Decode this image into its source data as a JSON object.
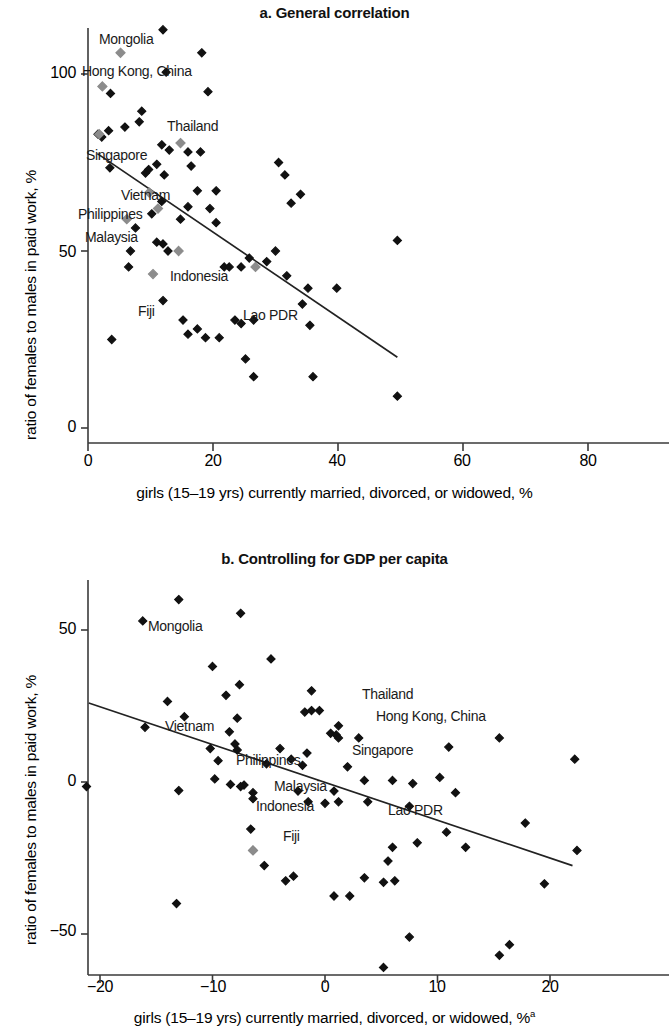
{
  "figure": {
    "panels": [
      {
        "id": "a",
        "title": "a. General correlation",
        "xlabel": "girls (15–19 yrs) currently married, divorced, or widowed, %",
        "ylabel": "ratio of females to males in paid work, %",
        "xlabel_superscript": "",
        "xticks": [
          "0",
          "20",
          "40",
          "60",
          "80"
        ],
        "yticks": [
          "0",
          "50",
          "100"
        ]
      },
      {
        "id": "b",
        "title": "b. Controlling for GDP per capita",
        "xlabel": "girls (15–19 yrs) currently married, divorced, or widowed, %",
        "ylabel": "ratio of females to males in paid work, %",
        "xlabel_superscript": "a",
        "xticks": [
          "−20",
          "−10",
          "0",
          "10",
          "20"
        ],
        "yticks": [
          "−50",
          "0",
          "50"
        ]
      }
    ],
    "colors": {
      "marker": "#111111",
      "highlight_marker": "#8c8c8c",
      "axis": "#3a3a3a",
      "trendline": "#222222",
      "text": "#111111"
    }
  },
  "chart_data": [
    {
      "type": "scatter",
      "panel": "a",
      "title": "a. General correlation",
      "xlabel": "girls (15–19 yrs) currently married, divorced, or widowed, %",
      "ylabel": "ratio of females to males in paid work, %",
      "xlim": [
        0,
        80
      ],
      "ylim": [
        0,
        118
      ],
      "xticks": [
        0,
        20,
        40,
        60,
        80
      ],
      "yticks": [
        0,
        50,
        100
      ],
      "grid": false,
      "legend": null,
      "trendline": {
        "x0": 1.5,
        "y0": 77.5,
        "x1": 49.5,
        "y1": 20.0
      },
      "highlighted_points": [
        {
          "label": "Mongolia",
          "x": 5.2,
          "y": 106.0
        },
        {
          "label": "Hong Kong, China",
          "x": 2.3,
          "y": 96.5
        },
        {
          "label": "Thailand",
          "x": 14.8,
          "y": 80.5
        },
        {
          "label": "Singapore",
          "x": 1.8,
          "y": 83.0
        },
        {
          "label": "Vietnam",
          "x": 9.8,
          "y": 66.5
        },
        {
          "label": "Philippines",
          "x": 11.2,
          "y": 62.0
        },
        {
          "label": "Malaysia",
          "x": 6.2,
          "y": 59.0
        },
        {
          "label": "Indonesia",
          "x": 14.5,
          "y": 50.0
        },
        {
          "label": "Fiji",
          "x": 10.4,
          "y": 43.5
        },
        {
          "label": "Lao PDR",
          "x": 26.8,
          "y": 45.5
        }
      ],
      "points": [
        {
          "x": 12.0,
          "y": 112.5
        },
        {
          "x": 18.2,
          "y": 106.0
        },
        {
          "x": 12.5,
          "y": 100.5
        },
        {
          "x": 3.6,
          "y": 94.5
        },
        {
          "x": 19.2,
          "y": 95.0
        },
        {
          "x": 8.6,
          "y": 89.5
        },
        {
          "x": 5.9,
          "y": 85.0
        },
        {
          "x": 3.3,
          "y": 84.0
        },
        {
          "x": 8.2,
          "y": 86.5
        },
        {
          "x": 1.6,
          "y": 83.0
        },
        {
          "x": 2.2,
          "y": 82.2
        },
        {
          "x": 11.8,
          "y": 80.0
        },
        {
          "x": 16.0,
          "y": 78.0
        },
        {
          "x": 18.0,
          "y": 78.0
        },
        {
          "x": 13.0,
          "y": 78.5
        },
        {
          "x": 3.5,
          "y": 73.5
        },
        {
          "x": 11.0,
          "y": 74.5
        },
        {
          "x": 16.5,
          "y": 74.0
        },
        {
          "x": 9.2,
          "y": 72.0
        },
        {
          "x": 9.7,
          "y": 73.0
        },
        {
          "x": 12.2,
          "y": 71.5
        },
        {
          "x": 30.5,
          "y": 75.0
        },
        {
          "x": 31.5,
          "y": 71.5
        },
        {
          "x": 17.5,
          "y": 67.0
        },
        {
          "x": 20.5,
          "y": 67.0
        },
        {
          "x": 11.8,
          "y": 64.0
        },
        {
          "x": 34.0,
          "y": 66.0
        },
        {
          "x": 32.5,
          "y": 63.5
        },
        {
          "x": 16.0,
          "y": 62.5
        },
        {
          "x": 19.5,
          "y": 62.0
        },
        {
          "x": 10.2,
          "y": 60.5
        },
        {
          "x": 14.8,
          "y": 59.0
        },
        {
          "x": 20.5,
          "y": 58.0
        },
        {
          "x": 7.6,
          "y": 56.5
        },
        {
          "x": 11.0,
          "y": 52.5
        },
        {
          "x": 12.0,
          "y": 52.0
        },
        {
          "x": 6.8,
          "y": 50.0
        },
        {
          "x": 12.8,
          "y": 50.0
        },
        {
          "x": 30.0,
          "y": 50.0
        },
        {
          "x": 49.5,
          "y": 53.0
        },
        {
          "x": 6.5,
          "y": 45.5
        },
        {
          "x": 25.8,
          "y": 48.0
        },
        {
          "x": 21.8,
          "y": 45.5
        },
        {
          "x": 22.6,
          "y": 45.5
        },
        {
          "x": 24.5,
          "y": 45.5
        },
        {
          "x": 28.6,
          "y": 47.0
        },
        {
          "x": 31.8,
          "y": 43.0
        },
        {
          "x": 35.2,
          "y": 39.5
        },
        {
          "x": 39.8,
          "y": 39.5
        },
        {
          "x": 34.3,
          "y": 35.0
        },
        {
          "x": 12.0,
          "y": 36.0
        },
        {
          "x": 35.5,
          "y": 29.0
        },
        {
          "x": 15.2,
          "y": 30.5
        },
        {
          "x": 23.5,
          "y": 30.5
        },
        {
          "x": 24.5,
          "y": 29.5
        },
        {
          "x": 26.5,
          "y": 30.5
        },
        {
          "x": 17.5,
          "y": 28.0
        },
        {
          "x": 16.0,
          "y": 26.5
        },
        {
          "x": 18.8,
          "y": 25.5
        },
        {
          "x": 21.0,
          "y": 25.5
        },
        {
          "x": 3.8,
          "y": 25.0
        },
        {
          "x": 25.2,
          "y": 19.5
        },
        {
          "x": 26.5,
          "y": 14.5
        },
        {
          "x": 36.0,
          "y": 14.5
        },
        {
          "x": 49.5,
          "y": 9.0
        }
      ]
    },
    {
      "type": "scatter",
      "panel": "b",
      "title": "b. Controlling for GDP per capita",
      "xlabel": "girls (15–19 yrs) currently married, divorced, or widowed, %",
      "xlabel_note": "a",
      "ylabel": "ratio of females to males in paid work, %",
      "xlim": [
        -22,
        23
      ],
      "ylim": [
        -62,
        65
      ],
      "xticks": [
        -20,
        -10,
        0,
        10,
        20
      ],
      "yticks": [
        -50,
        0,
        50
      ],
      "grid": false,
      "legend": null,
      "trendline": {
        "x0": -21.0,
        "y0": 26.0,
        "x1": 22.0,
        "y1": -27.5
      },
      "highlighted_points": [
        {
          "label": "Fiji-cluster-gray",
          "x": -6.4,
          "y": -22.5
        }
      ],
      "labeled_points": [
        {
          "label": "Mongolia",
          "x": -16.2,
          "y": 53.0
        },
        {
          "label": "Vietnam",
          "x": -16.0,
          "y": 18.0
        },
        {
          "label": "Thailand",
          "x": -1.2,
          "y": 30.0
        },
        {
          "label": "Hong Kong, China",
          "x": -0.5,
          "y": 24.0
        },
        {
          "label": "Singapore",
          "x": -1.6,
          "y": 9.5
        },
        {
          "label": "Philippines",
          "x": -8.2,
          "y": 7.0
        },
        {
          "label": "Malaysia",
          "x": -7.2,
          "y": -1.0
        },
        {
          "label": "Indonesia",
          "x": -6.4,
          "y": -5.5
        },
        {
          "label": "Lao PDR",
          "x": 1.2,
          "y": -6.5
        },
        {
          "label": "Fiji",
          "x": -6.6,
          "y": -15.5
        }
      ],
      "points": [
        {
          "x": -13.0,
          "y": 60.0
        },
        {
          "x": -7.5,
          "y": 55.5
        },
        {
          "x": -16.2,
          "y": 53.0
        },
        {
          "x": -4.8,
          "y": 40.5
        },
        {
          "x": -10.0,
          "y": 38.0
        },
        {
          "x": -7.6,
          "y": 32.0
        },
        {
          "x": -8.8,
          "y": 28.5
        },
        {
          "x": -14.0,
          "y": 26.5
        },
        {
          "x": -1.2,
          "y": 30.0
        },
        {
          "x": -12.5,
          "y": 21.5
        },
        {
          "x": -7.8,
          "y": 21.0
        },
        {
          "x": -1.8,
          "y": 23.0
        },
        {
          "x": -1.2,
          "y": 23.5
        },
        {
          "x": -0.5,
          "y": 23.5
        },
        {
          "x": 1.2,
          "y": 18.5
        },
        {
          "x": -16.0,
          "y": 18.0
        },
        {
          "x": -8.5,
          "y": 16.5
        },
        {
          "x": 0.5,
          "y": 16.0
        },
        {
          "x": 1.0,
          "y": 15.5
        },
        {
          "x": 1.2,
          "y": 14.5
        },
        {
          "x": 3.0,
          "y": 14.5
        },
        {
          "x": 15.5,
          "y": 14.5
        },
        {
          "x": -8.0,
          "y": 12.5
        },
        {
          "x": -10.2,
          "y": 11.0
        },
        {
          "x": -7.8,
          "y": 10.5
        },
        {
          "x": -4.0,
          "y": 11.0
        },
        {
          "x": -1.6,
          "y": 9.5
        },
        {
          "x": 11.0,
          "y": 11.5
        },
        {
          "x": -9.5,
          "y": 7.0
        },
        {
          "x": -3.0,
          "y": 7.5
        },
        {
          "x": 22.2,
          "y": 7.5
        },
        {
          "x": -5.2,
          "y": 6.0
        },
        {
          "x": -2.0,
          "y": 5.5
        },
        {
          "x": 2.0,
          "y": 5.0
        },
        {
          "x": -9.8,
          "y": 1.0
        },
        {
          "x": 3.5,
          "y": 0.5
        },
        {
          "x": 6.0,
          "y": 0.5
        },
        {
          "x": 10.2,
          "y": 1.5
        },
        {
          "x": -21.2,
          "y": -1.5
        },
        {
          "x": -8.4,
          "y": -0.8
        },
        {
          "x": -7.2,
          "y": -1.0
        },
        {
          "x": -7.5,
          "y": -1.5
        },
        {
          "x": 7.8,
          "y": -0.5
        },
        {
          "x": -13.0,
          "y": -2.8
        },
        {
          "x": -6.4,
          "y": -3.5
        },
        {
          "x": -2.4,
          "y": -3.0
        },
        {
          "x": 0.8,
          "y": -3.0
        },
        {
          "x": 11.6,
          "y": -3.5
        },
        {
          "x": -6.4,
          "y": -5.5
        },
        {
          "x": -1.5,
          "y": -6.5
        },
        {
          "x": 0.0,
          "y": -7.0
        },
        {
          "x": 3.8,
          "y": -6.5
        },
        {
          "x": 1.2,
          "y": -6.5
        },
        {
          "x": 7.5,
          "y": -8.0
        },
        {
          "x": -6.6,
          "y": -15.5
        },
        {
          "x": 17.8,
          "y": -13.5
        },
        {
          "x": 10.8,
          "y": -16.5
        },
        {
          "x": -6.4,
          "y": -22.5
        },
        {
          "x": 8.2,
          "y": -20.0
        },
        {
          "x": 6.0,
          "y": -21.5
        },
        {
          "x": 12.5,
          "y": -21.5
        },
        {
          "x": 22.4,
          "y": -22.5
        },
        {
          "x": -5.4,
          "y": -27.5
        },
        {
          "x": 5.6,
          "y": -26.0
        },
        {
          "x": -3.5,
          "y": -32.5
        },
        {
          "x": -2.8,
          "y": -31.0
        },
        {
          "x": 3.5,
          "y": -31.5
        },
        {
          "x": 5.2,
          "y": -33.0
        },
        {
          "x": 6.2,
          "y": -32.5
        },
        {
          "x": 19.5,
          "y": -33.5
        },
        {
          "x": 0.8,
          "y": -37.5
        },
        {
          "x": 2.2,
          "y": -37.5
        },
        {
          "x": -13.2,
          "y": -40.0
        },
        {
          "x": 7.5,
          "y": -51.0
        },
        {
          "x": 16.4,
          "y": -53.5
        },
        {
          "x": 15.5,
          "y": -57.0
        },
        {
          "x": 5.2,
          "y": -61.0
        }
      ]
    }
  ]
}
